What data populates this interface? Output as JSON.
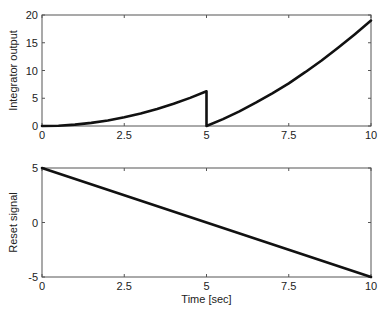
{
  "chart_data": [
    {
      "type": "line",
      "title": "",
      "xlabel": "",
      "ylabel": "Integrator output",
      "xlim": [
        0,
        10
      ],
      "ylim": [
        0,
        20
      ],
      "xticks": [
        0,
        2.5,
        5,
        7.5,
        10
      ],
      "xtick_labels": [
        "0",
        "2.5",
        "5",
        "7.5",
        "10"
      ],
      "yticks": [
        0,
        5,
        10,
        15,
        20
      ],
      "ytick_labels": [
        "0",
        "5",
        "10",
        "15",
        "20"
      ],
      "grid": false,
      "legend": null,
      "series": [
        {
          "name": "Integrator output",
          "color": "#111111",
          "x": [
            0,
            0.5,
            1,
            1.5,
            2,
            2.5,
            3,
            3.5,
            4,
            4.5,
            5,
            5,
            5.5,
            6,
            6.5,
            7,
            7.5,
            8,
            8.5,
            9,
            9.5,
            10
          ],
          "y": [
            0,
            0.06,
            0.25,
            0.56,
            1.0,
            1.56,
            2.25,
            3.06,
            4.0,
            5.06,
            6.25,
            0,
            1.25,
            2.65,
            4.2,
            5.9,
            7.7,
            9.7,
            11.8,
            14.1,
            16.5,
            19.0
          ]
        }
      ]
    },
    {
      "type": "line",
      "title": "",
      "xlabel": "Time [sec]",
      "ylabel": "Reset signal",
      "xlim": [
        0,
        10
      ],
      "ylim": [
        -5,
        5
      ],
      "xticks": [
        0,
        2.5,
        5,
        7.5,
        10
      ],
      "xtick_labels": [
        "0",
        "2.5",
        "5",
        "7.5",
        "10"
      ],
      "yticks": [
        -5,
        0,
        5
      ],
      "ytick_labels": [
        "-5",
        "0",
        "5"
      ],
      "grid": false,
      "legend": null,
      "series": [
        {
          "name": "Reset signal",
          "color": "#111111",
          "x": [
            0,
            10
          ],
          "y": [
            5,
            -5
          ]
        }
      ]
    }
  ],
  "layout": {
    "plots": [
      {
        "left": 42,
        "top": 15,
        "right": 371,
        "bottom": 126
      },
      {
        "left": 42,
        "top": 168,
        "right": 371,
        "bottom": 277
      }
    ]
  }
}
